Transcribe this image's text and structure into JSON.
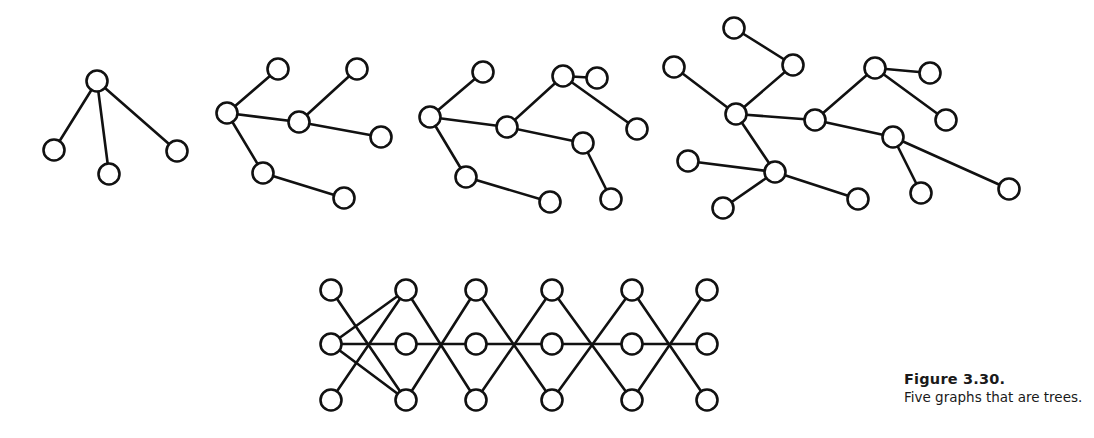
{
  "caption": {
    "title": "Figure 3.30.",
    "text": "Five graphs that are trees."
  },
  "style": {
    "stroke": "#111111",
    "node_fill": "#ffffff",
    "node_radius": 10.5,
    "stroke_width": 2.6
  },
  "graphs": [
    {
      "name": "tree-1",
      "nodes": [
        [
          97,
          81
        ],
        [
          54,
          150
        ],
        [
          109,
          174
        ],
        [
          177,
          151
        ]
      ],
      "edges": [
        [
          0,
          1
        ],
        [
          0,
          2
        ],
        [
          0,
          3
        ]
      ]
    },
    {
      "name": "tree-2",
      "nodes": [
        [
          227,
          113
        ],
        [
          278,
          69
        ],
        [
          357,
          69
        ],
        [
          299,
          122
        ],
        [
          381,
          137
        ],
        [
          263,
          173
        ],
        [
          344,
          198
        ]
      ],
      "edges": [
        [
          0,
          1
        ],
        [
          0,
          3
        ],
        [
          0,
          5
        ],
        [
          3,
          2
        ],
        [
          3,
          4
        ],
        [
          5,
          6
        ]
      ]
    },
    {
      "name": "tree-3",
      "nodes": [
        [
          430,
          117
        ],
        [
          483,
          72
        ],
        [
          507,
          127
        ],
        [
          563,
          76
        ],
        [
          597,
          78
        ],
        [
          637,
          129
        ],
        [
          583,
          143
        ],
        [
          466,
          177
        ],
        [
          550,
          202
        ],
        [
          611,
          199
        ]
      ],
      "edges": [
        [
          0,
          1
        ],
        [
          0,
          2
        ],
        [
          0,
          7
        ],
        [
          2,
          3
        ],
        [
          2,
          6
        ],
        [
          3,
          4
        ],
        [
          3,
          5
        ],
        [
          6,
          9
        ],
        [
          7,
          8
        ]
      ]
    },
    {
      "name": "tree-4",
      "nodes": [
        [
          734,
          28
        ],
        [
          674,
          67
        ],
        [
          793,
          65
        ],
        [
          736,
          114
        ],
        [
          815,
          120
        ],
        [
          688,
          161
        ],
        [
          775,
          172
        ],
        [
          723,
          208
        ],
        [
          858,
          199
        ],
        [
          875,
          68
        ],
        [
          930,
          73
        ],
        [
          946,
          120
        ],
        [
          893,
          137
        ],
        [
          921,
          193
        ],
        [
          1009,
          189
        ]
      ],
      "edges": [
        [
          0,
          2
        ],
        [
          2,
          3
        ],
        [
          1,
          3
        ],
        [
          3,
          4
        ],
        [
          3,
          6
        ],
        [
          6,
          5
        ],
        [
          6,
          7
        ],
        [
          6,
          8
        ],
        [
          4,
          9
        ],
        [
          9,
          10
        ],
        [
          9,
          11
        ],
        [
          4,
          12
        ],
        [
          12,
          13
        ],
        [
          12,
          14
        ]
      ]
    },
    {
      "name": "tree-5",
      "nodes": [
        [
          331,
          290
        ],
        [
          331,
          344
        ],
        [
          331,
          400
        ],
        [
          406,
          290
        ],
        [
          406,
          344
        ],
        [
          406,
          400
        ],
        [
          476,
          290
        ],
        [
          476,
          344
        ],
        [
          476,
          400
        ],
        [
          552,
          290
        ],
        [
          552,
          344
        ],
        [
          552,
          400
        ],
        [
          632,
          290
        ],
        [
          632,
          344
        ],
        [
          632,
          400
        ],
        [
          707,
          290
        ],
        [
          707,
          344
        ],
        [
          707,
          400
        ]
      ],
      "edges": [
        [
          0,
          5
        ],
        [
          1,
          3
        ],
        [
          1,
          4
        ],
        [
          1,
          5
        ],
        [
          2,
          3
        ],
        [
          3,
          8
        ],
        [
          5,
          6
        ],
        [
          4,
          7
        ],
        [
          6,
          11
        ],
        [
          8,
          9
        ],
        [
          7,
          10
        ],
        [
          9,
          14
        ],
        [
          11,
          12
        ],
        [
          10,
          13
        ],
        [
          12,
          17
        ],
        [
          14,
          15
        ],
        [
          13,
          16
        ]
      ]
    }
  ]
}
